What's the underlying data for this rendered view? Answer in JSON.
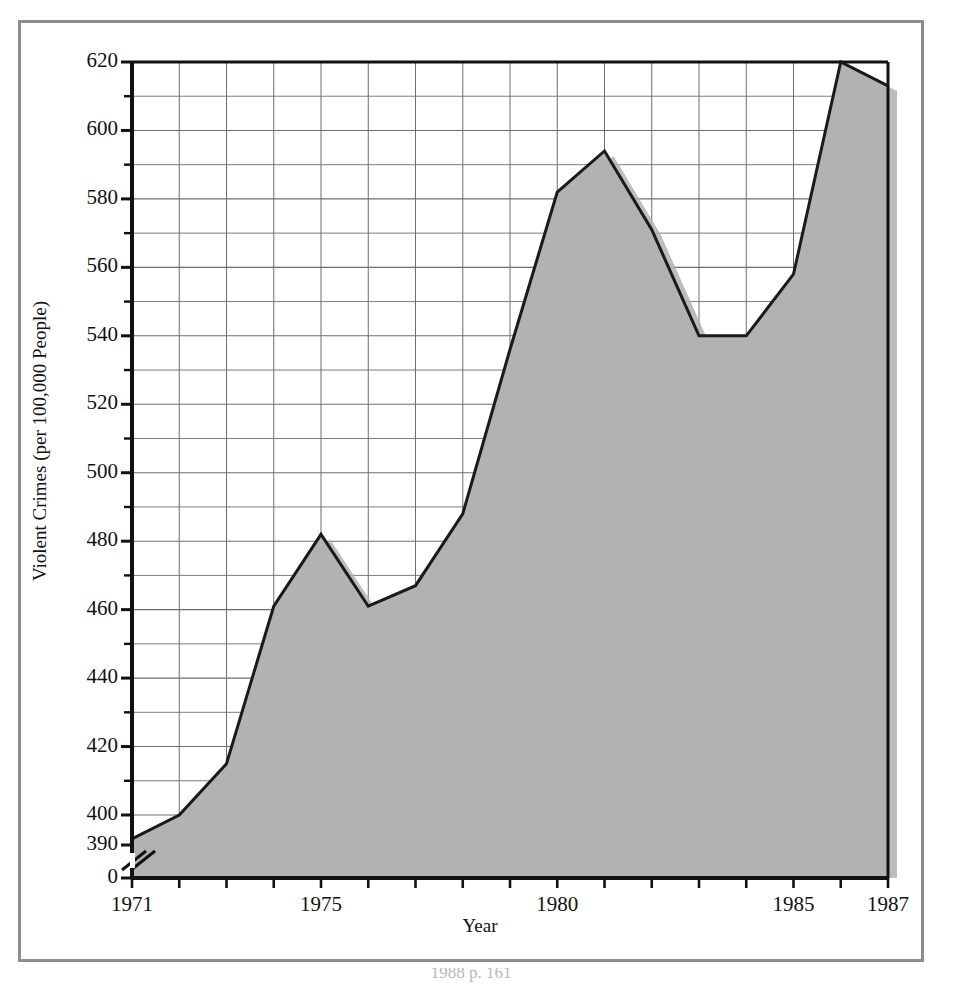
{
  "figure": {
    "border_color": "#8d8d8d",
    "background": "#ffffff",
    "caption_fragment": "1988 p. 161"
  },
  "chart_data": {
    "type": "area",
    "title": "",
    "subtitle": "",
    "xlabel": "Year",
    "ylabel": "Violent Crimes (per 100,000 People)",
    "x": [
      1971,
      1972,
      1973,
      1974,
      1975,
      1976,
      1977,
      1978,
      1979,
      1980,
      1981,
      1982,
      1983,
      1984,
      1985,
      1986,
      1987
    ],
    "values": [
      393,
      400,
      415,
      461,
      482,
      461,
      467,
      488,
      536,
      582,
      594,
      571,
      540,
      540,
      558,
      620,
      613
    ],
    "xlim": [
      1971,
      1987
    ],
    "ylim": [
      390,
      620
    ],
    "y_axis_break": true,
    "y_break_from": 0,
    "y_break_to": 390,
    "y_major_step": 20,
    "y_minor_step": 10,
    "x_tick_step": 1,
    "grid": true,
    "legend": "none",
    "series_name": "Violent Crimes",
    "fill_color": "#b2b2b2",
    "line_color": "#1a1a1a",
    "grid_color": "#6e6e6e",
    "axis_color": "#111111",
    "ytick_labels": [
      "620",
      "600",
      "580",
      "560",
      "540",
      "520",
      "500",
      "480",
      "460",
      "440",
      "420",
      "400",
      "390",
      "0"
    ],
    "ytick_values": [
      620,
      600,
      580,
      560,
      540,
      520,
      500,
      480,
      460,
      440,
      420,
      400,
      390,
      0
    ],
    "xtick_labels": [
      "1971",
      "1975",
      "1980",
      "1985",
      "1987"
    ],
    "xtick_values": [
      1971,
      1975,
      1980,
      1985,
      1987
    ]
  }
}
